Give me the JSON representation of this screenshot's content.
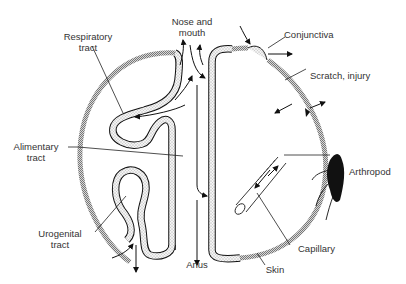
{
  "diagram": {
    "type": "anatomical schematic",
    "colors": {
      "background": "#ffffff",
      "ink": "#111111",
      "skin_shading": "#9a9a9a",
      "mucosa_stipple": "#777777",
      "text": "#333333"
    },
    "labels": {
      "nose_mouth_1": "Nose and",
      "nose_mouth_2": "mouth",
      "respiratory_1": "Respiratory",
      "respiratory_2": "tract",
      "conjunctiva": "Conjunctiva",
      "scratch": "Scratch, injury",
      "alimentary_1": "Alimentary",
      "alimentary_2": "tract",
      "arthropod": "Arthropod",
      "urogenital_1": "Urogenital",
      "urogenital_2": "tract",
      "capillary": "Capillary",
      "anus": "Anus",
      "skin": "Skin"
    }
  }
}
